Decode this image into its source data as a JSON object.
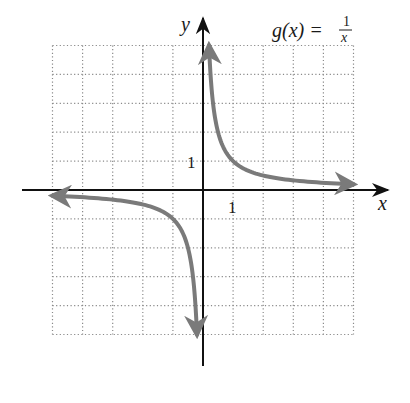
{
  "chart_data": {
    "type": "line",
    "function": {
      "name": "g",
      "variable": "x",
      "numerator": "1",
      "denominator": "x",
      "expression": "1/x"
    },
    "xlabel": "x",
    "ylabel": "y",
    "xlim": [
      -5,
      5
    ],
    "ylim": [
      -5,
      5
    ],
    "grid": true,
    "grid_style": "dotted",
    "tick_labels": {
      "x": "1",
      "y": "1"
    },
    "series": [
      {
        "name": "g(x) = 1/x, x > 0",
        "x": [
          0.2,
          0.25,
          0.333,
          0.5,
          1,
          2,
          3,
          4,
          5
        ],
        "y": [
          5,
          4,
          3,
          2,
          1,
          0.5,
          0.333,
          0.25,
          0.2
        ]
      },
      {
        "name": "g(x) = 1/x, x < 0",
        "x": [
          -0.2,
          -0.25,
          -0.333,
          -0.5,
          -1,
          -2,
          -3,
          -4,
          -5
        ],
        "y": [
          -5,
          -4,
          -3,
          -2,
          -1,
          -0.5,
          -0.333,
          -0.25,
          -0.2
        ]
      }
    ],
    "curve_color": "#7a7a7a",
    "axis_color": "#111111",
    "grid_color": "#8a8a8a"
  },
  "labels": {
    "title_lhs": "g(x) =",
    "title_num": "1",
    "title_den": "x",
    "x_axis": "x",
    "y_axis": "y",
    "x_tick": "1",
    "y_tick": "1"
  }
}
